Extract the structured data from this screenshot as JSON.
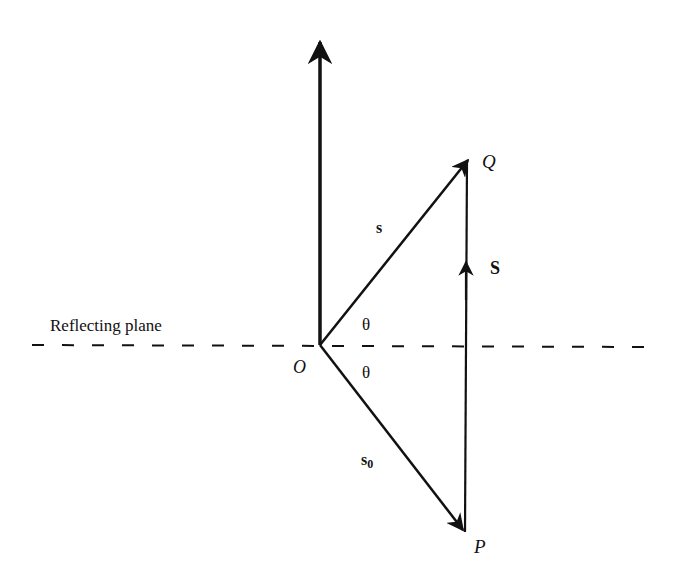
{
  "diagram": {
    "plane_label": "Reflecting plane",
    "origin_label": "O",
    "point_q_label": "Q",
    "point_p_label": "P",
    "vector_s_label": "s",
    "vector_s0_label": "s",
    "vector_s0_subscript": "0",
    "vector_S_label": "S",
    "angle_upper_label": "θ",
    "angle_lower_label": "θ",
    "colors": {
      "ink": "#111111",
      "background": "#ffffff"
    }
  }
}
